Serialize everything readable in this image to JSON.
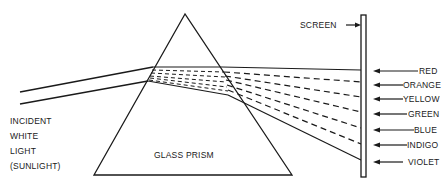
{
  "diagram": {
    "prism_label": "GLASS PRISM",
    "screen_label": "SCREEN",
    "incident_label": [
      "INCIDENT",
      "WHITE",
      "LIGHT",
      "(SUNLIGHT)"
    ],
    "spectrum": [
      {
        "name": "RED",
        "y": 71
      },
      {
        "name": "ORANGE",
        "y": 85
      },
      {
        "name": "YELLOW",
        "y": 99
      },
      {
        "name": "GREEN",
        "y": 114
      },
      {
        "name": "BLUE",
        "y": 130
      },
      {
        "name": "INDIGO",
        "y": 145
      },
      {
        "name": "VIOLET",
        "y": 162
      }
    ],
    "colors": {
      "ink": "#1a1a1a",
      "background": "#ffffff"
    }
  }
}
